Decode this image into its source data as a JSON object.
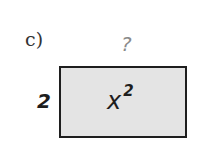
{
  "problem": {
    "label": "c)",
    "unknown_side": "?",
    "known_side": "2",
    "area_base": "x",
    "area_exponent": "2"
  }
}
